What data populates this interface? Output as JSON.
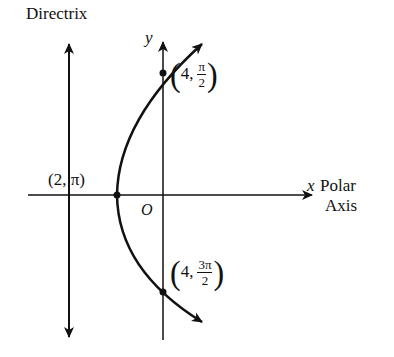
{
  "diagram": {
    "title": "Directrix",
    "axes": {
      "x_label": "x",
      "y_label": "y",
      "polar_axis_label_line1": "Polar",
      "polar_axis_label_line2": "Axis",
      "origin_label": "O"
    },
    "points": [
      {
        "label": "(2, π)",
        "r": "2",
        "theta": "π",
        "role": "vertex"
      },
      {
        "label": "(4, π/2)",
        "r": "4",
        "theta_num": "π",
        "theta_den": "2",
        "role": "upper-intercept"
      },
      {
        "label": "(4, 3π/2)",
        "r": "4",
        "theta_num": "3π",
        "theta_den": "2",
        "role": "lower-intercept"
      }
    ],
    "curve": "parabola opening right, focus at origin",
    "colors": {
      "ink": "#111111",
      "background": "#ffffff"
    }
  }
}
